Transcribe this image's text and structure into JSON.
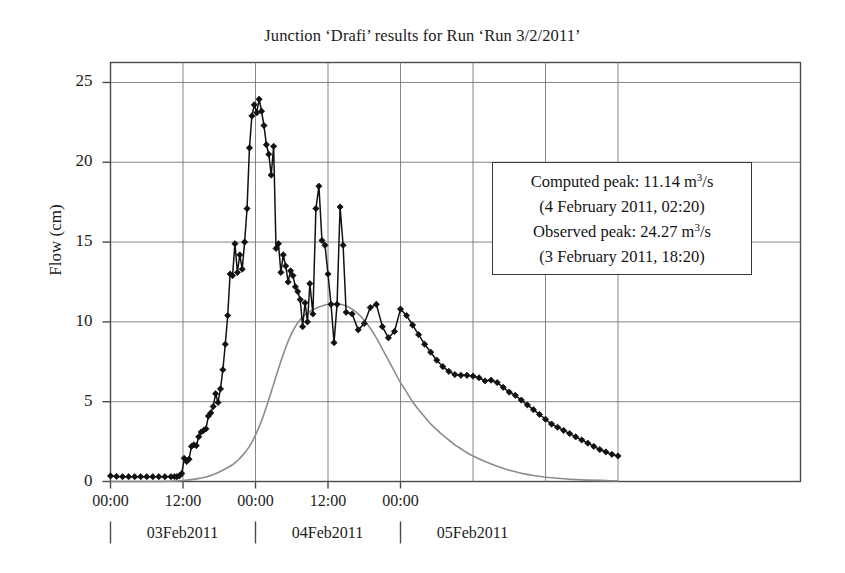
{
  "chart_data": {
    "type": "line",
    "title": "Junction ‘Drafi’ results for Run ‘Run 3/2/2011’",
    "xlabel": "",
    "ylabel": "Flow (cm)",
    "ylim": [
      0,
      26.25
    ],
    "xlim": [
      "02Feb2011 00:00",
      "05Feb2011 12:00"
    ],
    "grid": true,
    "legend_position": "inside-upper-right",
    "yticks": [
      0,
      5,
      10,
      15,
      20,
      25
    ],
    "ytick_labels": [
      "0",
      "5",
      "10",
      "15",
      "20",
      "25"
    ],
    "xticks": [
      "00:00",
      "12:00",
      "00:00",
      "12:00",
      "00:00"
    ],
    "xtick_dates": [
      "03Feb2011",
      "04Feb2011",
      "05Feb2011"
    ],
    "annotations": [
      "Computed peak: 11.14 m3/s",
      "(4 February 2011, 02:20)",
      "Observed peak: 24.27 m3/s",
      "(3 February 2011, 18:20)"
    ],
    "series": [
      {
        "name": "Observed",
        "style": "line-with-diamond-markers",
        "color": "#111111",
        "marker": "diamond",
        "x_hours": [
          0,
          1,
          2,
          3,
          4,
          5,
          6,
          7,
          8,
          9,
          10,
          10.6,
          11,
          11.4,
          11.8,
          12.2,
          12.6,
          13,
          13.4,
          13.8,
          14.2,
          14.6,
          15,
          15.4,
          15.8,
          16.2,
          16.6,
          17,
          17.4,
          17.8,
          18.2,
          18.6,
          19,
          19.4,
          19.8,
          20.2,
          20.6,
          21,
          21.4,
          21.8,
          22.2,
          22.6,
          23,
          23.4,
          23.8,
          24.2,
          24.6,
          25,
          25.4,
          25.8,
          26.2,
          26.6,
          27,
          27.4,
          27.8,
          28.2,
          28.6,
          29,
          29.4,
          29.8,
          30.2,
          30.6,
          31,
          31.4,
          31.8,
          32.2,
          32.6,
          33,
          33.5,
          34,
          34.5,
          35,
          35.5,
          36,
          36.5,
          37,
          37.5,
          38,
          38.5,
          39,
          40,
          41,
          42,
          43,
          44,
          45,
          46,
          47,
          48,
          49,
          50,
          51,
          52,
          53,
          54,
          55,
          56,
          57,
          58,
          59,
          60,
          61,
          62,
          63,
          64,
          65,
          66,
          67,
          68,
          69,
          70,
          71,
          72,
          73,
          74,
          75,
          76,
          77,
          78,
          79,
          80,
          81,
          82,
          83,
          84
        ],
        "y_values": [
          0.35,
          0.32,
          0.3,
          0.3,
          0.3,
          0.3,
          0.3,
          0.3,
          0.3,
          0.3,
          0.3,
          0.3,
          0.3,
          0.35,
          0.5,
          1.45,
          1.25,
          1.4,
          2.2,
          2.3,
          2.25,
          2.8,
          3.1,
          3.2,
          3.3,
          4.1,
          4.3,
          4.7,
          5.5,
          4.95,
          5.8,
          7.0,
          8.6,
          10.4,
          13.0,
          12.9,
          14.9,
          13.1,
          14.2,
          13.3,
          15.0,
          17.1,
          20.9,
          22.9,
          23.6,
          23.1,
          23.95,
          23.2,
          22.3,
          21.1,
          20.5,
          19.2,
          21.0,
          14.6,
          14.9,
          13.1,
          14.2,
          13.5,
          12.5,
          13.2,
          12.9,
          12.2,
          11.9,
          11.4,
          9.7,
          11.2,
          10.0,
          12.4,
          10.5,
          17.1,
          18.5,
          15.1,
          14.8,
          13.0,
          11.1,
          8.7,
          11.1,
          17.2,
          14.8,
          10.6,
          10.5,
          9.5,
          9.9,
          10.9,
          11.1,
          9.7,
          9.0,
          9.4,
          10.8,
          10.4,
          9.8,
          9.2,
          8.6,
          8.1,
          7.6,
          7.2,
          6.9,
          6.7,
          6.65,
          6.65,
          6.6,
          6.5,
          6.3,
          6.35,
          6.2,
          5.9,
          5.6,
          5.4,
          5.1,
          4.8,
          4.5,
          4.2,
          3.9,
          3.6,
          3.4,
          3.2,
          3.0,
          2.8,
          2.6,
          2.4,
          2.2,
          2.0,
          1.85,
          1.7,
          1.6,
          1.5,
          1.4,
          1.3,
          1.2,
          1.1,
          1.05,
          1.0,
          0.95,
          0.9,
          0.85,
          0.82,
          0.8
        ]
      },
      {
        "name": "Computed",
        "style": "smooth-line",
        "color": "#8c8c8c",
        "marker": "none",
        "peak_value": 11.14,
        "peak_time": "4 February 2011, 02:20",
        "x_hours": [
          0,
          6,
          10,
          12,
          14,
          16,
          18,
          20,
          21,
          22,
          23,
          24,
          25,
          26,
          27,
          28,
          29,
          30,
          31,
          32,
          33,
          34,
          35,
          36,
          37,
          38,
          39,
          40,
          41,
          42,
          43,
          44,
          45,
          46,
          47,
          48,
          49,
          50,
          51,
          52,
          53,
          54,
          55,
          56,
          57,
          58,
          59,
          60,
          62,
          64,
          66,
          68,
          70,
          74,
          78,
          84
        ],
        "y_values": [
          0.0,
          0.0,
          0.02,
          0.06,
          0.15,
          0.3,
          0.6,
          1.0,
          1.3,
          1.7,
          2.2,
          2.9,
          3.8,
          4.9,
          6.1,
          7.3,
          8.4,
          9.3,
          9.95,
          10.4,
          10.65,
          10.85,
          11.0,
          11.1,
          11.14,
          11.1,
          11.0,
          10.8,
          10.5,
          10.1,
          9.6,
          9.0,
          8.3,
          7.6,
          6.9,
          6.2,
          5.6,
          5.0,
          4.5,
          4.05,
          3.6,
          3.25,
          2.9,
          2.6,
          2.3,
          2.05,
          1.8,
          1.6,
          1.25,
          0.95,
          0.7,
          0.52,
          0.38,
          0.2,
          0.1,
          0.04
        ]
      }
    ]
  },
  "legend": {
    "lines": [
      {
        "prefix": "Computed peak: 11.14 m",
        "sup": "3",
        "suffix": "/s"
      },
      {
        "text": "(4 February 2011, 02:20)"
      },
      {
        "prefix": "Observed peak: 24.27 m",
        "sup": "3",
        "suffix": "/s"
      },
      {
        "text": "(3 February 2011, 18:20)"
      }
    ]
  },
  "axes": {
    "ylabel": "Flow (cm)",
    "ytick_labels": [
      "25",
      "20",
      "15",
      "10",
      "5",
      "0"
    ],
    "xtick_labels": [
      "00:00",
      "12:00",
      "00:00",
      "12:00",
      "00:00"
    ],
    "xdate_labels": [
      "03Feb2011",
      "04Feb2011",
      "05Feb2011"
    ]
  },
  "title": "Junction ‘Drafi’ results for Run ‘Run 3/2/2011’",
  "colors": {
    "observed": "#111111",
    "computed": "#8c8c8c",
    "frame": "#4a4a4a",
    "grid": "#777777",
    "text": "#1b1b1b"
  }
}
